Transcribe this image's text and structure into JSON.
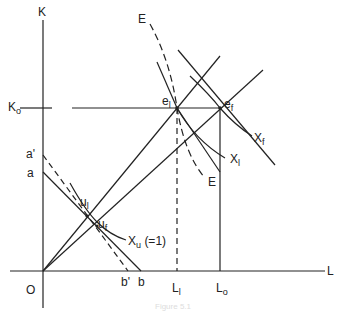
{
  "diagram": {
    "axes": {
      "y_label": "K",
      "x_label": "L",
      "origin_label": "O"
    },
    "y_ticks": [
      {
        "main": "K",
        "sub": "o"
      },
      {
        "main": "a'",
        "sub": ""
      },
      {
        "main": "a",
        "sub": ""
      }
    ],
    "x_ticks": [
      {
        "main": "b'",
        "sub": ""
      },
      {
        "main": "b",
        "sub": ""
      },
      {
        "main": "L",
        "sub": "l"
      },
      {
        "main": "L",
        "sub": "o"
      }
    ],
    "points": [
      {
        "main": "e",
        "sub": "l"
      },
      {
        "main": "e",
        "sub": "f"
      },
      {
        "main": "u",
        "sub": "l"
      },
      {
        "main": "u",
        "sub": "f"
      }
    ],
    "curves": [
      {
        "main": "X",
        "sub": "f"
      },
      {
        "main": "X",
        "sub": "l"
      },
      {
        "main": "X",
        "sub": "u",
        "extra": "(=1)"
      },
      {
        "main": "E",
        "sub": ""
      },
      {
        "main": "E",
        "sub": ""
      }
    ],
    "caption": "Figure 5.1"
  }
}
